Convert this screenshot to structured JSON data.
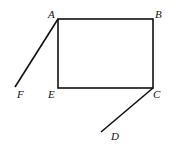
{
  "diagram": {
    "points": {
      "A": {
        "label": "A",
        "x": 58,
        "y": 19
      },
      "B": {
        "label": "B",
        "x": 153,
        "y": 19
      },
      "C": {
        "label": "C",
        "x": 153,
        "y": 88
      },
      "E": {
        "label": "E",
        "x": 58,
        "y": 88
      },
      "F": {
        "label": "F",
        "x": 15,
        "y": 87
      },
      "D": {
        "label": "D",
        "x": 101,
        "y": 132
      }
    },
    "segments": [
      [
        "A",
        "B"
      ],
      [
        "B",
        "C"
      ],
      [
        "C",
        "E"
      ],
      [
        "E",
        "A"
      ],
      [
        "A",
        "F"
      ],
      [
        "C",
        "D"
      ]
    ],
    "labels": {
      "A": "A",
      "B": "B",
      "C": "C",
      "D": "D",
      "E": "E",
      "F": "F"
    }
  }
}
